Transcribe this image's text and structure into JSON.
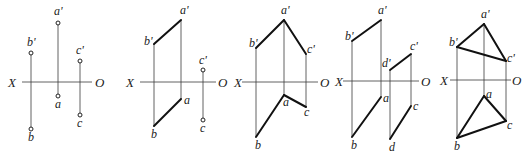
{
  "diagram": {
    "type": "orthographic-projection-figures",
    "axis_labels": {
      "left": "X",
      "right": "O"
    },
    "panels": [
      {
        "id": "panel-1",
        "description": "three separate points",
        "axis": {
          "x1": 22,
          "x2": 92,
          "y": 82,
          "xlabel_x": 8,
          "olabel_x": 95
        },
        "points": [
          {
            "name": "a'",
            "x": 58,
            "y": 23,
            "lx": 54,
            "ly": 15
          },
          {
            "name": "b'",
            "x": 31,
            "y": 53,
            "lx": 27,
            "ly": 46
          },
          {
            "name": "c'",
            "x": 80,
            "y": 61,
            "lx": 76,
            "ly": 54
          },
          {
            "name": "a",
            "x": 58,
            "y": 96,
            "lx": 55,
            "ly": 108
          },
          {
            "name": "b",
            "x": 31,
            "y": 129,
            "lx": 28,
            "ly": 141
          },
          {
            "name": "c",
            "x": 80,
            "y": 115,
            "lx": 77,
            "ly": 127
          }
        ],
        "projectors": [
          [
            31,
            53,
            31,
            129
          ],
          [
            58,
            23,
            58,
            96
          ],
          [
            80,
            61,
            80,
            115
          ]
        ],
        "edges": [],
        "show_point_markers": true
      },
      {
        "id": "panel-2",
        "description": "line AB and point C",
        "axis": {
          "x1": 140,
          "x2": 216,
          "y": 82,
          "xlabel_x": 126,
          "olabel_x": 218
        },
        "points": [
          {
            "name": "a'",
            "x": 181,
            "y": 20,
            "lx": 180,
            "ly": 14
          },
          {
            "name": "b'",
            "x": 154,
            "y": 44,
            "lx": 144,
            "ly": 45
          },
          {
            "name": "c'",
            "x": 203,
            "y": 70,
            "lx": 199,
            "ly": 64
          },
          {
            "name": "a",
            "x": 181,
            "y": 99,
            "lx": 184,
            "ly": 104
          },
          {
            "name": "b",
            "x": 154,
            "y": 126,
            "lx": 151,
            "ly": 138
          },
          {
            "name": "c",
            "x": 203,
            "y": 120,
            "lx": 200,
            "ly": 132
          }
        ],
        "projectors": [
          [
            154,
            44,
            154,
            126
          ],
          [
            181,
            20,
            181,
            99
          ],
          [
            203,
            70,
            203,
            120
          ]
        ],
        "edges": [
          [
            154,
            44,
            181,
            20
          ],
          [
            154,
            126,
            181,
            99
          ]
        ],
        "markers": [
          "c'",
          "c"
        ]
      },
      {
        "id": "panel-3",
        "description": "two intersecting lines AB and AC",
        "axis": {
          "x1": 242,
          "x2": 318,
          "y": 82,
          "xlabel_x": 234,
          "olabel_x": 320
        },
        "points": [
          {
            "name": "a'",
            "x": 284,
            "y": 20,
            "lx": 281,
            "ly": 14
          },
          {
            "name": "b'",
            "x": 256,
            "y": 48,
            "lx": 249,
            "ly": 47
          },
          {
            "name": "c'",
            "x": 306,
            "y": 54,
            "lx": 307,
            "ly": 53
          },
          {
            "name": "a",
            "x": 284,
            "y": 95,
            "lx": 283,
            "ly": 106
          },
          {
            "name": "b",
            "x": 256,
            "y": 137,
            "lx": 255,
            "ly": 149
          },
          {
            "name": "c",
            "x": 306,
            "y": 107,
            "lx": 304,
            "ly": 116
          }
        ],
        "projectors": [
          [
            256,
            48,
            256,
            137
          ],
          [
            284,
            20,
            284,
            95
          ],
          [
            306,
            54,
            306,
            107
          ]
        ],
        "edges": [
          [
            256,
            48,
            284,
            20
          ],
          [
            284,
            20,
            306,
            54
          ],
          [
            256,
            137,
            284,
            95
          ],
          [
            284,
            95,
            306,
            107
          ]
        ],
        "markers": []
      },
      {
        "id": "panel-4",
        "description": "two parallel lines AB and CD",
        "axis": {
          "x1": 343,
          "x2": 419,
          "y": 81,
          "xlabel_x": 335,
          "olabel_x": 421
        },
        "points": [
          {
            "name": "a'",
            "x": 381,
            "y": 20,
            "lx": 378,
            "ly": 14
          },
          {
            "name": "b'",
            "x": 352,
            "y": 41,
            "lx": 345,
            "ly": 40
          },
          {
            "name": "c'",
            "x": 411,
            "y": 54,
            "lx": 410,
            "ly": 50
          },
          {
            "name": "d'",
            "x": 390,
            "y": 70,
            "lx": 382,
            "ly": 67
          },
          {
            "name": "a",
            "x": 381,
            "y": 97,
            "lx": 383,
            "ly": 102
          },
          {
            "name": "b",
            "x": 352,
            "y": 137,
            "lx": 351,
            "ly": 149
          },
          {
            "name": "c",
            "x": 411,
            "y": 106,
            "lx": 413,
            "ly": 110
          },
          {
            "name": "d",
            "x": 390,
            "y": 139,
            "lx": 389,
            "ly": 151
          }
        ],
        "projectors": [
          [
            352,
            41,
            352,
            137
          ],
          [
            381,
            20,
            381,
            97
          ],
          [
            390,
            70,
            390,
            139
          ],
          [
            411,
            54,
            411,
            106
          ]
        ],
        "edges": [
          [
            352,
            41,
            381,
            20
          ],
          [
            390,
            70,
            411,
            54
          ],
          [
            352,
            137,
            381,
            97
          ],
          [
            390,
            139,
            411,
            106
          ]
        ],
        "markers": []
      },
      {
        "id": "panel-5",
        "description": "triangle ABC",
        "axis": {
          "x1": 450,
          "x2": 511,
          "y": 80,
          "xlabel_x": 440,
          "olabel_x": 512
        },
        "points": [
          {
            "name": "a'",
            "x": 484,
            "y": 24,
            "lx": 481,
            "ly": 18
          },
          {
            "name": "b'",
            "x": 457,
            "y": 47,
            "lx": 449,
            "ly": 46
          },
          {
            "name": "c'",
            "x": 506,
            "y": 61,
            "lx": 507,
            "ly": 62
          },
          {
            "name": "a",
            "x": 484,
            "y": 96,
            "lx": 486,
            "ly": 98
          },
          {
            "name": "b",
            "x": 457,
            "y": 138,
            "lx": 454,
            "ly": 150
          },
          {
            "name": "c",
            "x": 506,
            "y": 121,
            "lx": 507,
            "ly": 129
          }
        ],
        "projectors": [
          [
            457,
            47,
            457,
            138
          ],
          [
            484,
            24,
            484,
            96
          ],
          [
            506,
            61,
            506,
            121
          ]
        ],
        "edges": [
          [
            457,
            47,
            484,
            24
          ],
          [
            484,
            24,
            506,
            61
          ],
          [
            457,
            47,
            506,
            61
          ],
          [
            457,
            138,
            484,
            96
          ],
          [
            484,
            96,
            506,
            121
          ],
          [
            457,
            138,
            506,
            121
          ]
        ],
        "markers": []
      }
    ]
  }
}
